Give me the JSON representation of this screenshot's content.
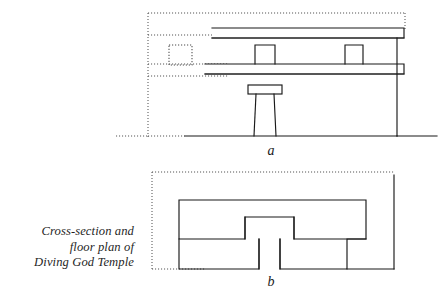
{
  "figure": {
    "caption_lines": [
      "Cross-section and",
      "floor plan of",
      "Diving God Temple"
    ],
    "caption_full": "Cross-section and floor plan of Diving God Temple",
    "panels": [
      {
        "id": "a",
        "label": "a",
        "title": "Cross-section",
        "description": "Cross-section of Diving God Temple showing two roof beams, two niche openings in the upper wall, a central column with capital, a dotted projected opening at left, and dotted construction lines defining the building envelope."
      },
      {
        "id": "b",
        "label": "b",
        "title": "Floor plan",
        "description": "Floor plan of Diving God Temple showing a wide rear chamber, a T-shaped entrance passage at center, and the building outline in dotted construction lines."
      }
    ],
    "line_styles": {
      "solid_label": "solid structural line",
      "dotted_label": "dotted construction / hidden line"
    },
    "colors": {
      "background": "#ffffff",
      "ink": "#191919",
      "dotted_ink": "#555555"
    }
  }
}
